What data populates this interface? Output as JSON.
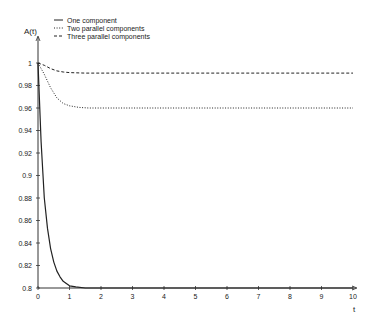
{
  "chart_data": {
    "type": "line",
    "title": "",
    "xlabel": "t",
    "ylabel": "A(t)",
    "xlim": [
      0,
      10
    ],
    "ylim": [
      0.8,
      1.0
    ],
    "x_ticks": [
      "0",
      "1",
      "2",
      "3",
      "4",
      "5",
      "6",
      "7",
      "8",
      "9",
      "10"
    ],
    "y_ticks": [
      "0.8",
      "0.82",
      "0.84",
      "0.86",
      "0.88",
      "0.9",
      "0.92",
      "0.94",
      "0.96",
      "0.98",
      "1"
    ],
    "grid": false,
    "legend_position": "top-left",
    "series": [
      {
        "name": "One component",
        "style": "solid",
        "x": [
          0,
          0.1,
          0.2,
          0.3,
          0.4,
          0.5,
          0.6,
          0.7,
          0.8,
          1.0,
          1.2,
          1.5,
          2,
          10
        ],
        "values": [
          1.0,
          0.93,
          0.88,
          0.853,
          0.835,
          0.823,
          0.815,
          0.81,
          0.806,
          0.802,
          0.801,
          0.8,
          0.8,
          0.8
        ]
      },
      {
        "name": "Two parallel components",
        "style": "dotted",
        "x": [
          0,
          0.2,
          0.4,
          0.6,
          0.8,
          1.0,
          1.3,
          1.6,
          2,
          10
        ],
        "values": [
          1.0,
          0.99,
          0.978,
          0.969,
          0.964,
          0.962,
          0.9605,
          0.96,
          0.96,
          0.96
        ]
      },
      {
        "name": "Three parallel components",
        "style": "dashed",
        "x": [
          0,
          0.2,
          0.4,
          0.6,
          0.8,
          1.0,
          1.5,
          2,
          10
        ],
        "values": [
          1.0,
          0.998,
          0.995,
          0.993,
          0.992,
          0.9915,
          0.991,
          0.991,
          0.991
        ]
      }
    ]
  }
}
